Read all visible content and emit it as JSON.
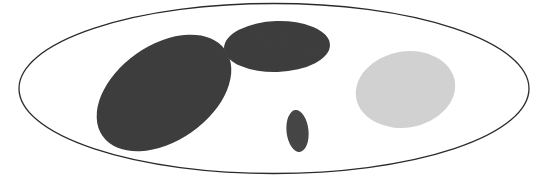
{
  "figure": {
    "canvas": {
      "width": 551,
      "height": 185,
      "background": "#ffffff"
    },
    "outer_boundary": {
      "label": "outer-ellipse",
      "cx": 274,
      "cy": 88.5,
      "rx": 255,
      "ry": 85,
      "rotation": 0,
      "fill": "none",
      "stroke": "#2b2b2b",
      "stroke_width": 1.3
    },
    "inner_ellipses": [
      {
        "label": "large-dark-left-ellipse",
        "cx": 164,
        "cy": 93,
        "rx": 75,
        "ry": 48,
        "rotation": -35,
        "fill": "#3e3e3e",
        "shade": "dark"
      },
      {
        "label": "wide-dark-top-ellipse",
        "cx": 277,
        "cy": 46.5,
        "rx": 53,
        "ry": 25.5,
        "rotation": -2,
        "fill": "#3f3f3f",
        "shade": "dark"
      },
      {
        "label": "small-dark-bottom-ellipse",
        "cx": 297.5,
        "cy": 131,
        "rx": 11,
        "ry": 21,
        "rotation": -6,
        "fill": "#474747",
        "shade": "dark"
      },
      {
        "label": "large-light-right-ellipse",
        "cx": 405.5,
        "cy": 89.5,
        "rx": 50,
        "ry": 38,
        "rotation": -10,
        "fill": "#d3d3d3",
        "shade": "light"
      }
    ]
  }
}
